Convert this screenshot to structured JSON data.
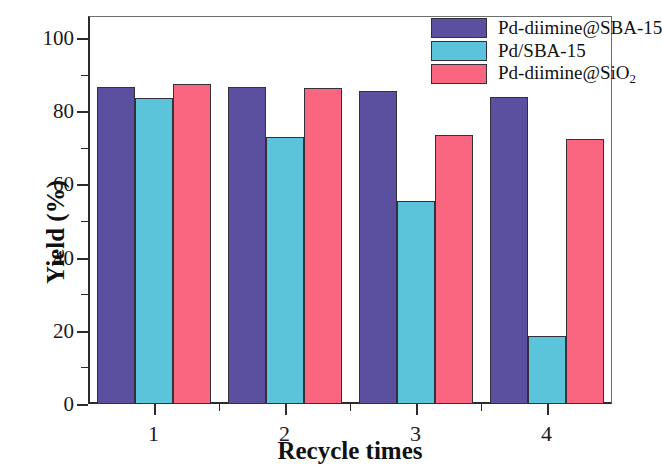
{
  "chart_data": {
    "type": "bar",
    "title": "",
    "xlabel": "Recycle times",
    "ylabel": "Yield (%)",
    "categories": [
      "1",
      "2",
      "3",
      "4"
    ],
    "ylim": [
      0,
      106
    ],
    "yticks": [
      0,
      20,
      40,
      60,
      80,
      100
    ],
    "ytick_labels": [
      "0",
      "20",
      "40",
      "60",
      "80",
      "100"
    ],
    "yminor_ticks": [
      10,
      30,
      50,
      70,
      90
    ],
    "grid": false,
    "legend_position": "top-right",
    "series": [
      {
        "name": "Pd-diimine@SBA-15",
        "color": "#5B4FA0",
        "values": [
          86.5,
          86.5,
          85.5,
          84.0
        ]
      },
      {
        "name": "Pd/SBA-15",
        "color": "#5BC4DA",
        "values": [
          83.5,
          73.0,
          55.5,
          18.6
        ]
      },
      {
        "name": "Pd-diimine@SiO2",
        "color": "#FA6680",
        "values": [
          87.5,
          86.3,
          73.5,
          72.5
        ]
      }
    ]
  },
  "legend": {
    "items": [
      {
        "label_html": "Pd-diimine@SBA-15",
        "color": "#5B4FA0"
      },
      {
        "label_html": "Pd/SBA-15",
        "color": "#5BC4DA"
      },
      {
        "label_html": "Pd-diimine@SiO<sub>2</sub>",
        "color": "#FA6680"
      }
    ]
  },
  "axes": {
    "bar_outline_color": "#33303a",
    "axis_color": "#2b2b2b"
  }
}
